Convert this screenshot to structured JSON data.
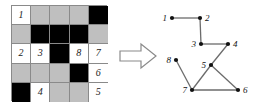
{
  "figure": {
    "background_color": "#ffffff"
  },
  "grid": {
    "name": "puzzle-grid",
    "rows": 5,
    "cols": 5,
    "colors": {
      "white": "#ffffff",
      "gray": "#bfbfbf",
      "black": "#000000",
      "border": "#8a8a8a"
    },
    "cells": [
      {
        "state": "white",
        "label": "1"
      },
      {
        "state": "gray",
        "label": ""
      },
      {
        "state": "gray",
        "label": ""
      },
      {
        "state": "gray",
        "label": ""
      },
      {
        "state": "black",
        "label": ""
      },
      {
        "state": "gray",
        "label": ""
      },
      {
        "state": "black",
        "label": ""
      },
      {
        "state": "black",
        "label": ""
      },
      {
        "state": "black",
        "label": ""
      },
      {
        "state": "gray",
        "label": ""
      },
      {
        "state": "white",
        "label": "2"
      },
      {
        "state": "white",
        "label": "3"
      },
      {
        "state": "black",
        "label": ""
      },
      {
        "state": "white",
        "label": "8"
      },
      {
        "state": "white",
        "label": "7"
      },
      {
        "state": "gray",
        "label": ""
      },
      {
        "state": "gray",
        "label": ""
      },
      {
        "state": "gray",
        "label": ""
      },
      {
        "state": "black",
        "label": ""
      },
      {
        "state": "white",
        "label": "6"
      },
      {
        "state": "black",
        "label": ""
      },
      {
        "state": "white",
        "label": "4"
      },
      {
        "state": "gray",
        "label": ""
      },
      {
        "state": "gray",
        "label": ""
      },
      {
        "state": "white",
        "label": "5"
      }
    ]
  },
  "arrow": {
    "name": "right-arrow-icon",
    "direction": "right",
    "fill": "#ffffff",
    "stroke": "#8a8a8a"
  },
  "chart_data": {
    "type": "diagram",
    "title": "",
    "node_color": "#111111",
    "edge_color": "#6b6b6b",
    "nodes": [
      {
        "id": "1",
        "x": 17,
        "y": 18,
        "label": "1",
        "label_pos": "left"
      },
      {
        "id": "2",
        "x": 45,
        "y": 18,
        "label": "2",
        "label_pos": "right"
      },
      {
        "id": "3",
        "x": 46,
        "y": 44,
        "label": "3",
        "label_pos": "left"
      },
      {
        "id": "4",
        "x": 73,
        "y": 44,
        "label": "4",
        "label_pos": "right"
      },
      {
        "id": "5",
        "x": 56,
        "y": 65,
        "label": "5",
        "label_pos": "left"
      },
      {
        "id": "6",
        "x": 83,
        "y": 90,
        "label": "6",
        "label_pos": "right"
      },
      {
        "id": "7",
        "x": 37,
        "y": 90,
        "label": "7",
        "label_pos": "left"
      },
      {
        "id": "8",
        "x": 21,
        "y": 60,
        "label": "8",
        "label_pos": "left"
      }
    ],
    "edges": [
      {
        "from": "1",
        "to": "2"
      },
      {
        "from": "2",
        "to": "3"
      },
      {
        "from": "3",
        "to": "4"
      },
      {
        "from": "4",
        "to": "5"
      },
      {
        "from": "5",
        "to": "6"
      },
      {
        "from": "5",
        "to": "7"
      },
      {
        "from": "7",
        "to": "6"
      },
      {
        "from": "8",
        "to": "7"
      }
    ]
  }
}
